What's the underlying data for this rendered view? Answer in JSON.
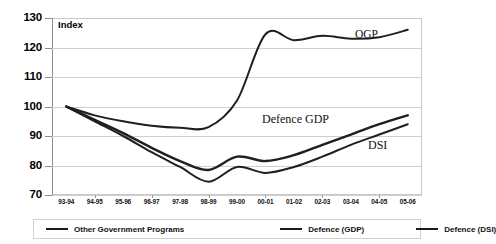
{
  "chart_data": {
    "type": "line",
    "title": "",
    "xlabel": "",
    "ylabel": "Index",
    "ylim": [
      70,
      130
    ],
    "yticks": [
      70,
      80,
      90,
      100,
      110,
      120,
      130
    ],
    "grid": true,
    "legend_position": "bottom",
    "categories": [
      "93-94",
      "94-95",
      "95-96",
      "96-97",
      "97-98",
      "98-99",
      "99-00",
      "00-01",
      "01-02",
      "02-03",
      "03-04",
      "04-05",
      "05-06"
    ],
    "series": [
      {
        "name": "Other Government Programs",
        "annotation": "OGP",
        "values": [
          100.0,
          97.0,
          95.0,
          93.5,
          92.8,
          93.0,
          102.0,
          124.5,
          122.5,
          124.0,
          123.0,
          123.5,
          126.0
        ]
      },
      {
        "name": "Defence (GDP)",
        "annotation": "Defence GDP",
        "values": [
          100.0,
          95.5,
          91.0,
          86.0,
          81.5,
          78.5,
          83.0,
          81.5,
          83.5,
          87.0,
          90.5,
          94.0,
          97.0
        ]
      },
      {
        "name": "Defence (DSI)",
        "annotation": "DSI",
        "values": [
          100.0,
          95.0,
          90.0,
          84.5,
          79.5,
          74.5,
          79.5,
          77.5,
          79.5,
          83.0,
          87.0,
          90.5,
          94.0
        ]
      }
    ]
  },
  "axis": {
    "index_label": "Index",
    "y_tick_labels": [
      "130",
      "120",
      "110",
      "100",
      "90",
      "80",
      "70"
    ],
    "x_tick_labels": [
      "93-94",
      "94-95",
      "95-96",
      "96-97",
      "97-98",
      "98-99",
      "99-00",
      "00-01",
      "01-02",
      "02-03",
      "03-04",
      "04-05",
      "05-06"
    ]
  },
  "annotations": {
    "ogp": "OGP",
    "defence_gdp": "Defence GDP",
    "dsi": "DSI"
  },
  "legend": {
    "items": [
      {
        "label": "Other Government Programs",
        "color": "#1a1a1a"
      },
      {
        "label": "Defence (GDP)",
        "color": "#1a1a1a"
      },
      {
        "label": "Defence (DSI)",
        "color": "#1a1a1a"
      }
    ]
  },
  "colors": {
    "line": "#1f1f1f",
    "grid": "#cfcfcf",
    "axis": "#8e8e8e",
    "background": "#ffffff"
  }
}
